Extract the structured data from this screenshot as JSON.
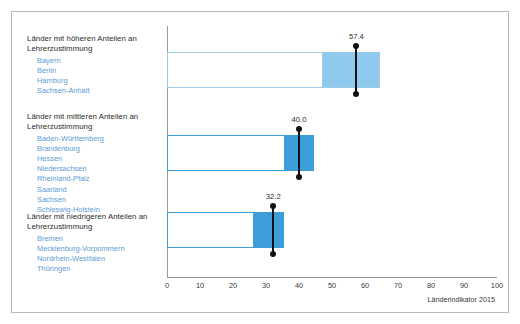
{
  "groups": [
    {
      "title_line1": "Länder mit höheren Anteilen an",
      "title_line2": "Lehrerzustimmung",
      "states": [
        "Bayern",
        "Berlin",
        "Hamburg",
        "Sachsen-Anhalt"
      ]
    },
    {
      "title_line1": "Länder mit mittleren Anteilen an",
      "title_line2": "Lehrerzustimmung",
      "states": [
        "Baden-Württemberg",
        "Brandenburg",
        "Hessen",
        "Niedersachsen",
        "Rheinland-Pfalz",
        "Saarland",
        "Sachsen",
        "Schleswig-Holstein"
      ]
    },
    {
      "title_line1": "Länder mit niedrigeren Anteilen an",
      "title_line2": "Lehrerzustimmung",
      "states": [
        "Bremen",
        "Mecklenburg-Vorpommern",
        "Nordrhein-Westfalen",
        "Thüringen"
      ]
    }
  ],
  "source_note": "Länderindikator 2015",
  "colors": {
    "bar_fill_high": "#8fc9ed",
    "bar_fill_mid": "#3c9dd8",
    "bar_outline_high": "#9ecbe6",
    "bar_outline_mid": "#3c9dd8",
    "marker": "#111111",
    "state_text": "#5b9bd5",
    "axis": "#9a9a9a"
  },
  "chart_data": {
    "type": "bar",
    "title": "",
    "xlabel": "",
    "ylabel": "",
    "xlim": [
      0,
      100
    ],
    "xticks": [
      0,
      10,
      20,
      30,
      40,
      50,
      60,
      70,
      80,
      90,
      100
    ],
    "grid": false,
    "legend": "none",
    "orientation": "horizontal",
    "categories": [
      "Länder mit höheren Anteilen an Lehrerzustimmung",
      "Länder mit mittleren Anteilen an Lehrerzustimmung",
      "Länder mit niedrigeren Anteilen an Lehrerzustimmung"
    ],
    "bars": [
      {
        "category": "Länder mit höheren Anteilen an Lehrerzustimmung",
        "range_start": 0,
        "range_end": 64.5,
        "fill_start": 47.0,
        "fill_end": 64.5,
        "marker_value": 57.4,
        "label": "57.4"
      },
      {
        "category": "Länder mit mittleren Anteilen an Lehrerzustimmung",
        "range_start": 0,
        "range_end": 44.5,
        "fill_start": 35.5,
        "fill_end": 44.5,
        "marker_value": 40.0,
        "label": "40.0"
      },
      {
        "category": "Länder mit niedrigeren Anteilen an Lehrerzustimmung",
        "range_start": 0,
        "range_end": 35.5,
        "fill_start": 26.0,
        "fill_end": 35.5,
        "marker_value": 32.2,
        "label": "32.2"
      }
    ],
    "values": [
      57.4,
      40.0,
      32.2
    ]
  },
  "tick_labels": [
    "0",
    "10",
    "20",
    "30",
    "40",
    "50",
    "60",
    "70",
    "80",
    "90",
    "100"
  ]
}
